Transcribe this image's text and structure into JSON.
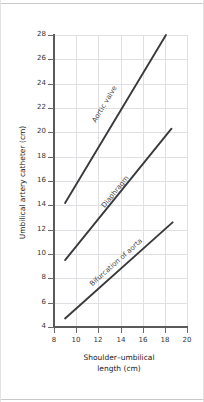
{
  "figure": {
    "type": "figure",
    "background": "#ffffff",
    "line_color": "#3a3a3a",
    "grid_color": "#e0e0e4",
    "axis_color": "#5a5a5a"
  },
  "chart_data": {
    "type": "line",
    "title": "",
    "xlabel_line1": "Shoulder–umbilical",
    "xlabel_line2": "length (cm)",
    "ylabel": "Umbilical artery catheter (cm)",
    "xlim": [
      8,
      20
    ],
    "ylim": [
      4,
      28
    ],
    "xticks": [
      8,
      10,
      12,
      14,
      16,
      18,
      20
    ],
    "yticks": [
      4,
      6,
      8,
      10,
      12,
      14,
      16,
      18,
      20,
      22,
      24,
      26,
      28
    ],
    "grid": true,
    "legend": "inline-labels",
    "series": [
      {
        "name": "Aortic valve",
        "label": "Aortic valve",
        "x": [
          9.0,
          18.1
        ],
        "y": [
          14.2,
          28.0
        ],
        "label_x": 11.6,
        "label_y": 21.2
      },
      {
        "name": "Diaphragm",
        "label": "Diaphragm",
        "x": [
          9.0,
          18.6
        ],
        "y": [
          9.5,
          20.3
        ],
        "label_x": 12.4,
        "label_y": 14.2
      },
      {
        "name": "Bifurcation of aorta",
        "label": "Bifurcation of aorta",
        "x": [
          9.0,
          18.7
        ],
        "y": [
          4.7,
          12.6
        ],
        "label_x": 11.3,
        "label_y": 7.8
      }
    ]
  }
}
